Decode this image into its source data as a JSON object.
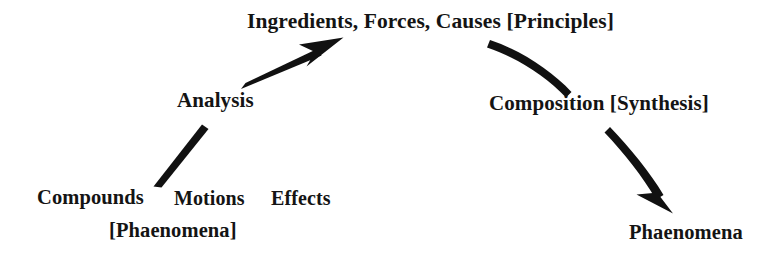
{
  "diagram": {
    "background_color": "#ffffff",
    "ink_color": "#111111",
    "nodes": {
      "top": "Ingredients, Forces, Causes [Principles]",
      "left_mid": "Analysis",
      "right_mid": "Composition [Synthesis]",
      "bottom_left_1": "Compounds",
      "bottom_left_2": "Motions",
      "bottom_left_3": "Effects",
      "bottom_left_bracket": "[Phaenomena]",
      "bottom_right": "Phaenomena"
    },
    "connectors": [
      {
        "name": "phaenomena-to-analysis",
        "kind": "line",
        "arrowhead": false,
        "from": "[Phaenomena]",
        "to": "Analysis"
      },
      {
        "name": "analysis-to-principles",
        "kind": "arrow",
        "arrowhead": true,
        "from": "Analysis",
        "to": "Ingredients, Forces, Causes [Principles]"
      },
      {
        "name": "principles-to-composition",
        "kind": "curve",
        "arrowhead": false,
        "from": "Ingredients, Forces, Causes [Principles]",
        "to": "Composition [Synthesis]"
      },
      {
        "name": "composition-to-phaenomena",
        "kind": "arrow",
        "arrowhead": true,
        "from": "Composition [Synthesis]",
        "to": "Phaenomena"
      }
    ]
  }
}
